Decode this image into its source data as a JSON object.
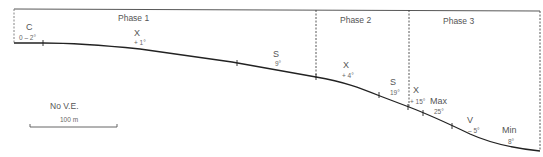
{
  "phases": [
    {
      "label": "Phase 1"
    },
    {
      "label": "Phase 2"
    },
    {
      "label": "Phase 3"
    }
  ],
  "segments": [
    {
      "code": "C",
      "angle": "0 – 2°"
    },
    {
      "code": "X",
      "angle": "+ 1°"
    },
    {
      "code": "S",
      "angle": "9°"
    },
    {
      "code": "X",
      "angle": "+ 4°"
    },
    {
      "code": "S",
      "angle": "19°"
    },
    {
      "code": "X",
      "angle": "+ 15°"
    },
    {
      "code": "Max",
      "angle": "25°"
    },
    {
      "code": "V",
      "angle": "– 5°"
    },
    {
      "code": "Min",
      "angle": "8°"
    }
  ],
  "scale": {
    "note": "No V.E.",
    "bar_label": "100 m"
  },
  "colors": {
    "line": "#222222",
    "frame": "#444444",
    "text": "#555555"
  }
}
